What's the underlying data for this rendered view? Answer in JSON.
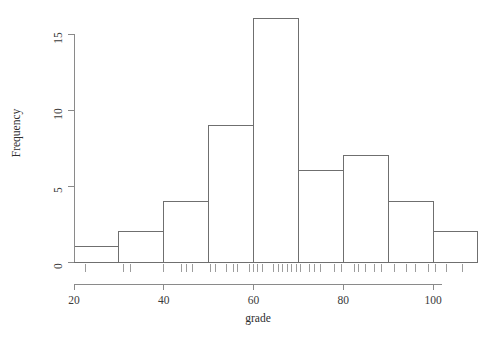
{
  "chart_data": {
    "type": "bar",
    "title": "",
    "subtitle": "",
    "xlabel": "grade",
    "ylabel": "Frequency",
    "categories": [
      "20-30",
      "30-40",
      "40-50",
      "50-60",
      "60-70",
      "70-80",
      "80-90",
      "90-100",
      "100-110"
    ],
    "bin_edges": [
      20,
      30,
      40,
      50,
      60,
      70,
      80,
      90,
      100,
      110
    ],
    "values": [
      1,
      2,
      4,
      9,
      16,
      6,
      7,
      4,
      2
    ],
    "xlim": [
      20,
      110
    ],
    "ylim": [
      0,
      16
    ],
    "xticks": [
      20,
      40,
      60,
      80,
      100
    ],
    "xtick_labels": [
      "20",
      "40",
      "60",
      "80",
      "100"
    ],
    "yticks": [
      0,
      5,
      10,
      15
    ],
    "ytick_labels": [
      "0",
      "5",
      "10",
      "15"
    ],
    "grid": false,
    "legend": false,
    "legend_position": "none",
    "rug": {
      "present": true,
      "values": [
        22.5,
        31.0,
        32.5,
        40.0,
        44.0,
        45.0,
        46.5,
        50.5,
        51.5,
        54.0,
        55.5,
        56.5,
        59.0,
        60.0,
        61.0,
        62.0,
        64.5,
        65.5,
        66.5,
        67.5,
        68.5,
        69.5,
        70.5,
        72.5,
        73.5,
        75.0,
        78.0,
        79.5,
        82.5,
        83.5,
        85.0,
        87.0,
        88.5,
        91.5,
        94.0,
        96.0,
        99.0,
        100.5,
        103.0,
        106.5
      ]
    }
  },
  "colors": {
    "background": "#ffffff",
    "bar_fill": "#ffffff",
    "bar_stroke": "#6f6f6f",
    "axis": "#8a8a8a",
    "text": "#2e2e2e",
    "rug": "#9d9d9d"
  }
}
